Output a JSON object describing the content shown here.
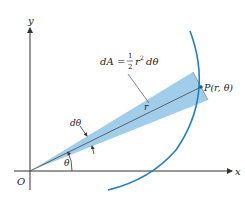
{
  "figure": {
    "axes": {
      "x_label": "x",
      "y_label": "y",
      "origin_label": "O"
    },
    "formula": {
      "lhs": "dA",
      "eq": "=",
      "num": "1",
      "den": "2",
      "rest_r": "r",
      "rest_exp": "2",
      "rest_d": "dθ"
    },
    "labels": {
      "point": "P(r, θ)",
      "radius": "r",
      "dtheta": "dθ",
      "theta": "θ"
    },
    "colors": {
      "curve": "#1f7fc4",
      "wedge": "#8ec4e6",
      "axes": "#333333",
      "text": "#222222"
    }
  }
}
